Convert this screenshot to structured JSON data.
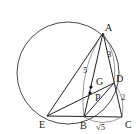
{
  "diagram": {
    "type": "geometry",
    "points": {
      "A": {
        "label": "A",
        "x": 103,
        "y": 33
      },
      "E": {
        "label": "E",
        "x": 47,
        "y": 116
      },
      "B": {
        "label": "B",
        "x": 84,
        "y": 117
      },
      "C": {
        "label": "C",
        "x": 122,
        "y": 117
      },
      "D": {
        "label": "D",
        "x": 114,
        "y": 83
      },
      "G": {
        "label": "G",
        "x": 91,
        "y": 87
      },
      "P": {
        "label": "P",
        "x": 90,
        "y": 93
      }
    },
    "lengths": {
      "AB": "5",
      "AD": "3",
      "DC": "2",
      "BC": "√5"
    },
    "circle": {
      "cx": 68,
      "cy": 75,
      "r": 54
    }
  }
}
